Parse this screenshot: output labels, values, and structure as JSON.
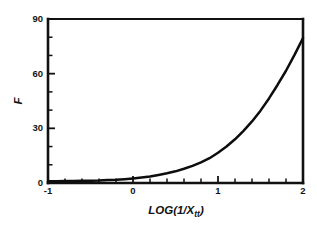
{
  "chart_data": {
    "type": "line",
    "title": "",
    "xlabel": "LOG(1/Xtt)",
    "xlabel_main": "LOG(1/X",
    "xlabel_sub": "tt",
    "xlabel_close": ")",
    "ylabel": "F",
    "xlim": [
      -1,
      2
    ],
    "ylim": [
      0,
      90
    ],
    "grid": false,
    "legend": false,
    "x_major_ticks": [
      -1,
      0,
      1,
      2
    ],
    "x_major_tick_labels": [
      "-1",
      "0",
      "1",
      "2"
    ],
    "x_minor_tick_interval": 0.2,
    "y_major_ticks": [
      0,
      30,
      60,
      90
    ],
    "y_major_tick_labels": [
      "0",
      "30",
      "60",
      "90"
    ],
    "y_minor_tick_interval": 10,
    "series": [
      {
        "name": "F",
        "x": [
          -1.0,
          -0.9,
          -0.8,
          -0.7,
          -0.6,
          -0.5,
          -0.4,
          -0.3,
          -0.2,
          -0.1,
          0.0,
          0.1,
          0.2,
          0.3,
          0.4,
          0.5,
          0.6,
          0.7,
          0.8,
          0.9,
          1.0,
          1.1,
          1.2,
          1.3,
          1.4,
          1.5,
          1.6,
          1.7,
          1.8,
          1.9,
          2.0
        ],
        "values": [
          1.0,
          1.0,
          1.1,
          1.1,
          1.2,
          1.3,
          1.4,
          1.6,
          1.8,
          2.1,
          2.5,
          3.0,
          3.6,
          4.4,
          5.3,
          6.4,
          7.8,
          9.4,
          11.3,
          13.6,
          16.6,
          20.0,
          24.0,
          28.6,
          33.8,
          39.7,
          46.4,
          53.8,
          61.6,
          70.3,
          79.5
        ]
      }
    ],
    "colors": {
      "curve": "#0d0d0d",
      "axis": "#111111",
      "background": "#ffffff",
      "text": "#151515"
    }
  }
}
